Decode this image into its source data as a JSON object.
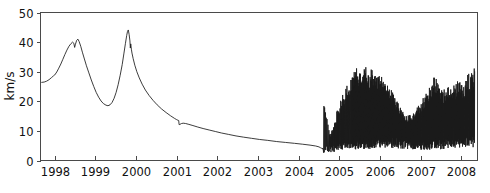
{
  "chart_data": {
    "type": "line",
    "title": "",
    "xlabel": "",
    "ylabel": "km/s",
    "xlim": [
      1997.65,
      2008.4
    ],
    "ylim": [
      0,
      50
    ],
    "grid": false,
    "legend": null,
    "x_ticks": [
      1998,
      1999,
      2000,
      2001,
      2002,
      2003,
      2004,
      2005,
      2006,
      2007,
      2008
    ],
    "x_tick_labels": [
      "1998",
      "1999",
      "2000",
      "2001",
      "2002",
      "2003",
      "2004",
      "2005",
      "2006",
      "2007",
      "2008"
    ],
    "y_ticks": [
      0,
      10,
      20,
      30,
      40,
      50
    ],
    "y_tick_labels": [
      "0",
      "10",
      "20",
      "30",
      "40",
      "50"
    ],
    "series": [
      {
        "name": "velocity",
        "color": "#1a1a1a",
        "description": "Smooth double-peak rise and slow decay 1998-2004.5, then dense high-frequency oscillation 2004.5-2008",
        "smooth_segment": [
          [
            1997.68,
            26.4
          ],
          [
            1997.74,
            26.5
          ],
          [
            1997.8,
            26.8
          ],
          [
            1997.86,
            27.3
          ],
          [
            1997.92,
            28.0
          ],
          [
            1997.97,
            28.6
          ],
          [
            1998.0,
            28.9
          ],
          [
            1998.05,
            29.9
          ],
          [
            1998.1,
            31.2
          ],
          [
            1998.15,
            32.6
          ],
          [
            1998.2,
            34.2
          ],
          [
            1998.25,
            35.8
          ],
          [
            1998.3,
            37.3
          ],
          [
            1998.35,
            38.6
          ],
          [
            1998.4,
            39.5
          ],
          [
            1998.44,
            40.0
          ],
          [
            1998.47,
            39.6
          ],
          [
            1998.49,
            38.2
          ],
          [
            1998.51,
            39.3
          ],
          [
            1998.54,
            40.6
          ],
          [
            1998.57,
            41.0
          ],
          [
            1998.6,
            40.2
          ],
          [
            1998.64,
            38.6
          ],
          [
            1998.68,
            36.6
          ],
          [
            1998.73,
            34.3
          ],
          [
            1998.78,
            32.0
          ],
          [
            1998.84,
            29.6
          ],
          [
            1998.9,
            27.2
          ],
          [
            1998.96,
            25.0
          ],
          [
            1999.02,
            23.0
          ],
          [
            1999.08,
            21.4
          ],
          [
            1999.14,
            20.1
          ],
          [
            1999.2,
            19.2
          ],
          [
            1999.26,
            18.7
          ],
          [
            1999.31,
            18.5
          ],
          [
            1999.36,
            18.8
          ],
          [
            1999.41,
            19.6
          ],
          [
            1999.46,
            21.0
          ],
          [
            1999.51,
            23.0
          ],
          [
            1999.56,
            25.6
          ],
          [
            1999.61,
            28.8
          ],
          [
            1999.66,
            32.4
          ],
          [
            1999.7,
            36.0
          ],
          [
            1999.74,
            39.6
          ],
          [
            1999.77,
            42.2
          ],
          [
            1999.79,
            43.6
          ],
          [
            1999.81,
            44.1
          ],
          [
            1999.83,
            42.6
          ],
          [
            1999.85,
            40.4
          ],
          [
            1999.86,
            38.0
          ],
          [
            1999.87,
            39.4
          ],
          [
            1999.885,
            37.6
          ],
          [
            1999.9,
            36.3
          ],
          [
            1999.93,
            34.4
          ],
          [
            1999.97,
            32.2
          ],
          [
            2000.02,
            30.0
          ],
          [
            2000.08,
            27.9
          ],
          [
            2000.15,
            25.8
          ],
          [
            2000.23,
            23.8
          ],
          [
            2000.32,
            22.0
          ],
          [
            2000.42,
            20.3
          ],
          [
            2000.52,
            18.8
          ],
          [
            2000.63,
            17.4
          ],
          [
            2000.74,
            16.2
          ],
          [
            2000.85,
            15.1
          ],
          [
            2000.95,
            14.2
          ],
          [
            2001.0,
            13.8
          ],
          [
            2001.03,
            13.6
          ],
          [
            2001.05,
            13.5
          ],
          [
            2001.06,
            12.1
          ],
          [
            2001.08,
            12.2
          ],
          [
            2001.12,
            12.5
          ],
          [
            2001.16,
            12.6
          ],
          [
            2001.22,
            12.5
          ],
          [
            2001.3,
            12.2
          ],
          [
            2001.4,
            11.8
          ],
          [
            2001.52,
            11.3
          ],
          [
            2001.65,
            10.8
          ],
          [
            2001.8,
            10.3
          ],
          [
            2001.95,
            9.8
          ],
          [
            2002.1,
            9.3
          ],
          [
            2002.28,
            8.8
          ],
          [
            2002.46,
            8.3
          ],
          [
            2002.64,
            7.9
          ],
          [
            2002.84,
            7.5
          ],
          [
            2003.04,
            7.1
          ],
          [
            2003.24,
            6.8
          ],
          [
            2003.46,
            6.4
          ],
          [
            2003.68,
            6.1
          ],
          [
            2003.9,
            5.8
          ],
          [
            2004.1,
            5.5
          ],
          [
            2004.28,
            5.2
          ],
          [
            2004.42,
            4.9
          ],
          [
            2004.5,
            4.6
          ],
          [
            2004.54,
            4.3
          ],
          [
            2004.57,
            4.1
          ],
          [
            2004.59,
            4.0
          ]
        ],
        "oscillation_start_year": 2004.59,
        "oscillation_end_year": 2008.33,
        "oscillation_notes": "High-frequency spiky oscillation; baseline near 4-8, spike tops rise from ~22 at 2004.6 to ~30 around 2005.7, drop to ~15 near 2006.6, then climb again to ~30 by 2008"
      }
    ]
  },
  "axis_labels": {
    "y_title": "km/s"
  },
  "colors": {
    "curve": "#1a1a1a",
    "axis": "#4a4a4a",
    "background": "#ffffff"
  }
}
